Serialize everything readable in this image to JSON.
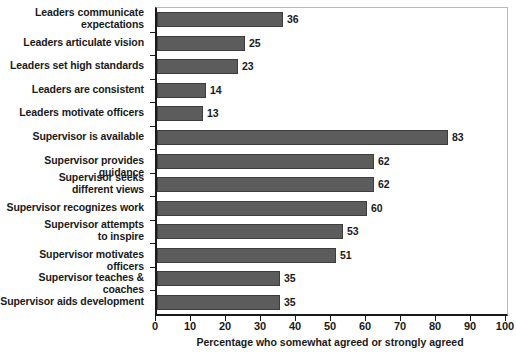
{
  "chart_data": {
    "type": "bar",
    "orientation": "horizontal",
    "title": "",
    "xlabel": "Percentage who somewhat agreed or strongly agreed",
    "ylabel": "",
    "xlim": [
      0,
      100
    ],
    "xticks": [
      0,
      10,
      20,
      30,
      40,
      50,
      60,
      70,
      80,
      90,
      100
    ],
    "xtick_labels": [
      "0",
      "10",
      "20",
      "30",
      "40",
      "50",
      "60",
      "70",
      "80",
      "90",
      "100"
    ],
    "grid": false,
    "legend": false,
    "bar_color": "#5c5c5c",
    "bar_edge_color": "#3d3d3d",
    "show_value_labels": true,
    "categories": [
      "Leaders communicate\nexpectations",
      "Leaders articulate vision",
      "Leaders set high standards",
      "Leaders are consistent",
      "Leaders motivate officers",
      "Supervisor is available",
      "Supervisor provides guidance",
      "Supervisor seeks\ndifferent views",
      "Supervisor recognizes work",
      "Supervisor attempts\nto inspire",
      "Supervisor motivates officers",
      "Supervisor teaches & coaches",
      "Supervisor aids development"
    ],
    "values": [
      36,
      25,
      23,
      14,
      13,
      83,
      62,
      62,
      60,
      53,
      51,
      35,
      35
    ],
    "value_labels": [
      "36",
      "25",
      "23",
      "14",
      "13",
      "83",
      "62",
      "62",
      "60",
      "53",
      "51",
      "35",
      "35"
    ]
  }
}
